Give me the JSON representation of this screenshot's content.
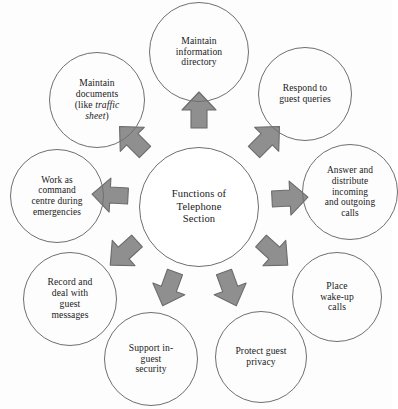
{
  "diagram": {
    "title": "Functions of Telephone Section",
    "type": "radial-hub-and-spoke",
    "hub": {
      "label": "Functions of\nTelephone\nSection",
      "cx": 199,
      "cy": 207,
      "r": 60,
      "font_size": 10.6
    },
    "style": {
      "arrow_fill": "#8f8f8f",
      "arrow_stroke": "#6b6b6b",
      "circle_stroke": "#6f6f6f",
      "text_color": "#1a1a1a",
      "background": "#fdfdfd"
    },
    "nodes": [
      {
        "id": "maintain-information-directory",
        "label": "Maintain\ninformation\ndirectory",
        "cx": 199,
        "cy": 52,
        "r": 50,
        "font_size": 9.6,
        "width": 96
      },
      {
        "id": "respond-to-guest-queries",
        "label": "Respond to\nguest queries",
        "cx": 305,
        "cy": 94,
        "r": 47,
        "font_size": 9.6,
        "width": 92
      },
      {
        "id": "answer-and-distribute-calls",
        "label": "Answer and\ndistribute\nincoming\nand outgoing\ncalls",
        "cx": 350,
        "cy": 192,
        "r": 48,
        "font_size": 9.4,
        "width": 94
      },
      {
        "id": "place-wake-up-calls",
        "label": "Place\nwake-up\ncalls",
        "cx": 337,
        "cy": 297,
        "r": 45,
        "font_size": 9.6,
        "width": 84
      },
      {
        "id": "protect-guest-privacy",
        "label": "Protect guest\nprivacy",
        "cx": 261,
        "cy": 357,
        "r": 46,
        "font_size": 9.6,
        "width": 90
      },
      {
        "id": "support-in-guest-security",
        "label": "Support in-\nguest\nsecurity",
        "cx": 151,
        "cy": 359,
        "r": 47,
        "font_size": 9.6,
        "width": 88
      },
      {
        "id": "record-and-deal-with-guest-messages",
        "label": "Record and\ndeal with\nguest\nmessages",
        "cx": 70,
        "cy": 299,
        "r": 47,
        "font_size": 9.6,
        "width": 88
      },
      {
        "id": "work-as-command-centre",
        "label": "Work as\ncommand\ncentre during\nemergencies",
        "cx": 57,
        "cy": 196,
        "r": 47,
        "font_size": 9.4,
        "width": 92
      },
      {
        "id": "maintain-documents",
        "label_parts": [
          "Maintain\ndocuments\n(like ",
          "traffic\nsheet",
          ")"
        ],
        "label": "Maintain\ndocuments\n(like traffic\nsheet)",
        "italic_text": "traffic sheet",
        "cx": 97,
        "cy": 100,
        "r": 48,
        "font_size": 9.6,
        "width": 92
      }
    ],
    "arrows": [
      {
        "id": "arrow-up",
        "direction": "up",
        "angle": -90,
        "target": "maintain-information-directory"
      },
      {
        "id": "arrow-up-right",
        "direction": "up-right",
        "angle": -47,
        "target": "respond-to-guest-queries"
      },
      {
        "id": "arrow-right",
        "direction": "right",
        "angle": -5,
        "target": "answer-and-distribute-calls"
      },
      {
        "id": "arrow-down-right",
        "direction": "down-right",
        "angle": 40,
        "target": "place-wake-up-calls"
      },
      {
        "id": "arrow-down-right-lower",
        "direction": "down",
        "angle": 68,
        "target": "protect-guest-privacy"
      },
      {
        "id": "arrow-down-left-lower",
        "direction": "down",
        "angle": 112,
        "target": "support-in-guest-security"
      },
      {
        "id": "arrow-down-left",
        "direction": "down-left",
        "angle": 140,
        "target": "record-and-deal-with-guest-messages"
      },
      {
        "id": "arrow-left",
        "direction": "left",
        "angle": 185,
        "target": "work-as-command-centre"
      },
      {
        "id": "arrow-up-left",
        "direction": "up-left",
        "angle": 228,
        "target": "maintain-documents"
      }
    ]
  }
}
